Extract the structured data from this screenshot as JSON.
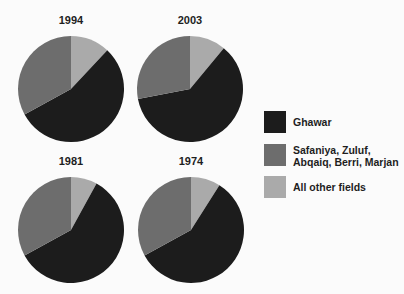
{
  "colors": {
    "ghawar": "#1c1c1c",
    "safaniya_group": "#6d6d6d",
    "other": "#aaaaaa",
    "background": "#fbfbfb"
  },
  "legend": {
    "items": [
      {
        "label": "Ghawar",
        "color": "#1c1c1c"
      },
      {
        "label": "Safaniya, Zuluf,\nAbqaiq, Berri, Marjan",
        "color": "#6d6d6d"
      },
      {
        "label": "All other fields",
        "color": "#aaaaaa"
      }
    ]
  },
  "pies": [
    {
      "title": "1994"
    },
    {
      "title": "2003"
    },
    {
      "title": "1981"
    },
    {
      "title": "1974"
    }
  ],
  "chart_data": {
    "type": "pie",
    "title": "",
    "categories": [
      "Ghawar",
      "Safaniya, Zuluf, Abqaiq, Berri, Marjan",
      "All other fields"
    ],
    "legend_position": "right",
    "charts": [
      {
        "title": "1994",
        "values": [
          55,
          33,
          12
        ]
      },
      {
        "title": "2003",
        "values": [
          61,
          28,
          11
        ]
      },
      {
        "title": "1981",
        "values": [
          59,
          33,
          8
        ]
      },
      {
        "title": "1974",
        "values": [
          58,
          33,
          9
        ]
      }
    ],
    "units": "percent (estimated from slice angles)",
    "start_angle": "Ghawar begins where 'All other fields' ends; 'All other fields' starts at 12 o'clock, clockwise order: other, Ghawar, Safaniya group"
  }
}
